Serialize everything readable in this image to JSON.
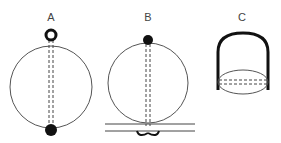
{
  "diagram": {
    "panels": [
      {
        "id": "A",
        "label": "A",
        "description": "circle with ring at top, dot at bottom, dashed double line through diameter"
      },
      {
        "id": "B",
        "label": "B",
        "description": "circle with dot at top, dashed double line down to two horizontal lines with curls below"
      },
      {
        "id": "C",
        "label": "C",
        "description": "arched thick bracket with ellipse at base and dashed double line across ellipse"
      }
    ]
  },
  "colors": {
    "stroke": "#222222",
    "thin_stroke": "#555555",
    "label": "#444444",
    "background": "#ffffff"
  }
}
